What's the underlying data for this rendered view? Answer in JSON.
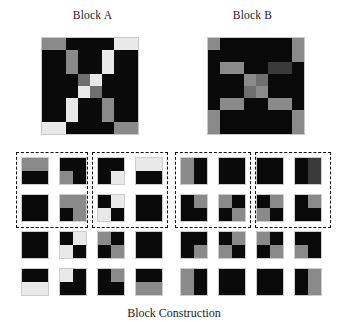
{
  "figure": {
    "caption": "Block Construction",
    "titles": {
      "block_a": "Block A",
      "block_b": "Block B"
    }
  },
  "palette": {
    "black": "#0a0a0a",
    "dark_gray": "#3a3a3a",
    "mid_gray": "#6f6f6f",
    "gray": "#8a8a8a",
    "light_gray": "#c6c6c6",
    "near_white": "#e9e9e9",
    "white": "#f4f4f4",
    "border": "#c9c9c9",
    "dash": "#111111",
    "background": "#ffffff",
    "text": "#1b1b1b"
  },
  "chart_data": {
    "type": "heatmap",
    "title": "Block Construction",
    "xlabel": "",
    "ylabel": "",
    "legend": [],
    "grid": true,
    "blocks": [
      {
        "name": "Block A",
        "rows": 8,
        "cols": 8,
        "matrix": [
          [
            "gray",
            "gray",
            "black",
            "black",
            "black",
            "black",
            "near_white",
            "near_white"
          ],
          [
            "black",
            "black",
            "gray",
            "black",
            "black",
            "near_white",
            "black",
            "black"
          ],
          [
            "black",
            "black",
            "gray",
            "black",
            "black",
            "near_white",
            "black",
            "black"
          ],
          [
            "black",
            "black",
            "black",
            "mid_gray",
            "near_white",
            "black",
            "black",
            "black"
          ],
          [
            "black",
            "black",
            "black",
            "near_white",
            "mid_gray",
            "black",
            "black",
            "black"
          ],
          [
            "black",
            "black",
            "near_white",
            "black",
            "black",
            "gray",
            "black",
            "black"
          ],
          [
            "black",
            "black",
            "near_white",
            "black",
            "black",
            "gray",
            "black",
            "black"
          ],
          [
            "near_white",
            "near_white",
            "black",
            "black",
            "black",
            "black",
            "gray",
            "gray"
          ]
        ]
      },
      {
        "name": "Block B",
        "rows": 8,
        "cols": 8,
        "matrix": [
          [
            "gray",
            "black",
            "black",
            "black",
            "black",
            "black",
            "black",
            "gray"
          ],
          [
            "black",
            "black",
            "black",
            "black",
            "black",
            "black",
            "black",
            "gray"
          ],
          [
            "black",
            "gray",
            "gray",
            "black",
            "black",
            "dark_gray",
            "dark_gray",
            "black"
          ],
          [
            "black",
            "black",
            "black",
            "gray",
            "mid_gray",
            "black",
            "black",
            "black"
          ],
          [
            "black",
            "black",
            "black",
            "mid_gray",
            "gray",
            "black",
            "black",
            "black"
          ],
          [
            "black",
            "gray",
            "gray",
            "black",
            "black",
            "gray",
            "gray",
            "black"
          ],
          [
            "gray",
            "black",
            "black",
            "black",
            "black",
            "black",
            "black",
            "gray"
          ],
          [
            "gray",
            "black",
            "black",
            "black",
            "black",
            "black",
            "black",
            "gray"
          ]
        ]
      }
    ],
    "sub_blocks": {
      "note": "Each sub-block is 2x2; cell order is [top-left, top-right, bottom-left, bottom-right].",
      "block_a": [
        {
          "row": 1,
          "col": 1,
          "dashed_group": "A1",
          "cells": [
            "gray",
            "gray",
            "black",
            "black"
          ]
        },
        {
          "row": 1,
          "col": 2,
          "dashed_group": "A1",
          "cells": [
            "black",
            "black",
            "gray",
            "black"
          ]
        },
        {
          "row": 1,
          "col": 3,
          "dashed_group": "A2",
          "cells": [
            "black",
            "black",
            "black",
            "near_white"
          ]
        },
        {
          "row": 1,
          "col": 4,
          "dashed_group": "A2",
          "cells": [
            "near_white",
            "near_white",
            "black",
            "black"
          ]
        },
        {
          "row": 2,
          "col": 1,
          "dashed_group": "A1",
          "cells": [
            "black",
            "black",
            "black",
            "black"
          ]
        },
        {
          "row": 2,
          "col": 2,
          "dashed_group": "A1",
          "cells": [
            "gray",
            "gray",
            "black",
            "gray"
          ]
        },
        {
          "row": 2,
          "col": 3,
          "dashed_group": "A2",
          "cells": [
            "black",
            "near_white",
            "near_white",
            "black"
          ]
        },
        {
          "row": 2,
          "col": 4,
          "dashed_group": "A2",
          "cells": [
            "black",
            "black",
            "black",
            "black"
          ]
        },
        {
          "row": 3,
          "col": 1,
          "dashed_group": null,
          "cells": [
            "black",
            "black",
            "black",
            "black"
          ]
        },
        {
          "row": 3,
          "col": 2,
          "dashed_group": null,
          "cells": [
            "black",
            "near_white",
            "near_white",
            "black"
          ]
        },
        {
          "row": 3,
          "col": 3,
          "dashed_group": null,
          "cells": [
            "gray",
            "black",
            "black",
            "gray"
          ]
        },
        {
          "row": 3,
          "col": 4,
          "dashed_group": null,
          "cells": [
            "black",
            "black",
            "black",
            "black"
          ]
        },
        {
          "row": 4,
          "col": 1,
          "dashed_group": null,
          "cells": [
            "black",
            "black",
            "near_white",
            "near_white"
          ]
        },
        {
          "row": 4,
          "col": 2,
          "dashed_group": null,
          "cells": [
            "near_white",
            "black",
            "black",
            "black"
          ]
        },
        {
          "row": 4,
          "col": 3,
          "dashed_group": null,
          "cells": [
            "black",
            "gray",
            "black",
            "black"
          ]
        },
        {
          "row": 4,
          "col": 4,
          "dashed_group": null,
          "cells": [
            "black",
            "black",
            "gray",
            "gray"
          ]
        }
      ],
      "block_b": [
        {
          "row": 1,
          "col": 1,
          "dashed_group": "B1",
          "cells": [
            "gray",
            "black",
            "gray",
            "black"
          ]
        },
        {
          "row": 1,
          "col": 2,
          "dashed_group": "B1",
          "cells": [
            "black",
            "black",
            "black",
            "black"
          ]
        },
        {
          "row": 1,
          "col": 3,
          "dashed_group": "B2",
          "cells": [
            "black",
            "black",
            "black",
            "black"
          ]
        },
        {
          "row": 1,
          "col": 4,
          "dashed_group": "B2",
          "cells": [
            "black",
            "dark_gray",
            "black",
            "dark_gray"
          ]
        },
        {
          "row": 2,
          "col": 1,
          "dashed_group": "B1",
          "cells": [
            "black",
            "gray",
            "black",
            "black"
          ]
        },
        {
          "row": 2,
          "col": 2,
          "dashed_group": "B1",
          "cells": [
            "gray",
            "black",
            "black",
            "gray"
          ]
        },
        {
          "row": 2,
          "col": 3,
          "dashed_group": "B2",
          "cells": [
            "black",
            "gray",
            "gray",
            "black"
          ]
        },
        {
          "row": 2,
          "col": 4,
          "dashed_group": "B2",
          "cells": [
            "black",
            "gray",
            "black",
            "black"
          ]
        },
        {
          "row": 3,
          "col": 1,
          "dashed_group": null,
          "cells": [
            "black",
            "black",
            "black",
            "gray"
          ]
        },
        {
          "row": 3,
          "col": 2,
          "dashed_group": null,
          "cells": [
            "black",
            "gray",
            "gray",
            "black"
          ]
        },
        {
          "row": 3,
          "col": 3,
          "dashed_group": null,
          "cells": [
            "gray",
            "black",
            "black",
            "gray"
          ]
        },
        {
          "row": 3,
          "col": 4,
          "dashed_group": null,
          "cells": [
            "black",
            "black",
            "gray",
            "black"
          ]
        },
        {
          "row": 4,
          "col": 1,
          "dashed_group": null,
          "cells": [
            "gray",
            "black",
            "gray",
            "black"
          ]
        },
        {
          "row": 4,
          "col": 2,
          "dashed_group": null,
          "cells": [
            "black",
            "black",
            "black",
            "black"
          ]
        },
        {
          "row": 4,
          "col": 3,
          "dashed_group": null,
          "cells": [
            "black",
            "black",
            "black",
            "black"
          ]
        },
        {
          "row": 4,
          "col": 4,
          "dashed_group": null,
          "cells": [
            "black",
            "gray",
            "black",
            "gray"
          ]
        }
      ]
    },
    "sub_block_layout": {
      "block_a_origin_x": 22,
      "block_b_origin_x": 181,
      "origin_y": 158,
      "col_step": 38,
      "row_step": 37
    }
  }
}
